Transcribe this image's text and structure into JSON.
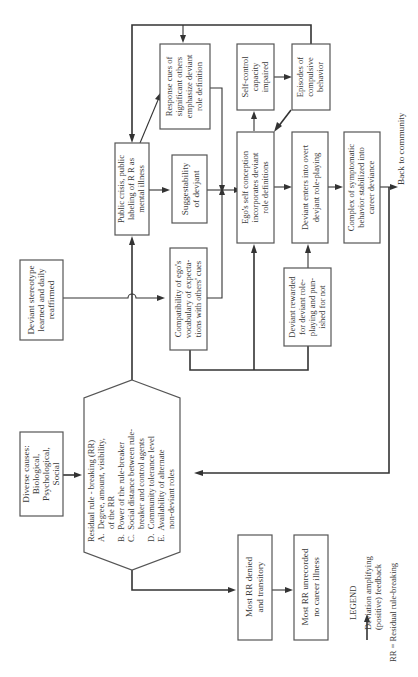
{
  "nodes": {
    "diverse_causes": {
      "lines": [
        "Diverse causes:",
        "Biological,",
        "Psychological,",
        "Social"
      ]
    },
    "residual_rule_breaking": {
      "lines": [
        "Residual rule - breaking (RR)",
        "A.  Degree, amount, visibility,",
        "      of the RR",
        "B.  Power of the rule-breaker",
        "C.  Social distance between rule-",
        "      breaker and control agents",
        "D.  Community tolerance level",
        "E.  Availability of alternate",
        "      non-deviant roles"
      ]
    },
    "deviant_stereotype": {
      "lines": [
        "Deviant stereotype",
        "learned and daily",
        "reaffirmed"
      ]
    },
    "most_rr_denied": {
      "lines": [
        "Most RR denied",
        "and transitory"
      ]
    },
    "most_rr_unrecorded": {
      "lines": [
        "Most RR unrecorded",
        "no career illness"
      ]
    },
    "public_crisis": {
      "lines": [
        "Public crisis, public",
        "labeling of R R as",
        "mental illness"
      ]
    },
    "compatibility": {
      "lines": [
        "Compatibility of ego's",
        "vocabulary of expecta-",
        "tions with others' cues"
      ]
    },
    "suggestability": {
      "lines": [
        "Suggestability",
        "of devjant"
      ]
    },
    "response_cues": {
      "lines": [
        "Response cues of",
        "significant others",
        "emphasize deviant",
        "role definition"
      ]
    },
    "ego_self_conception": {
      "lines": [
        "Ego's self conception",
        "incorporates deviant",
        "role definitions"
      ]
    },
    "self_control": {
      "lines": [
        "Self-control",
        "capacity",
        "impaired"
      ]
    },
    "episodes": {
      "lines": [
        "Episodes of",
        "compulsive",
        "behavior"
      ]
    },
    "deviant_rewarded": {
      "lines": [
        "Deviant rewarded",
        "for deviant role-",
        "playing and pun-",
        "ished for not"
      ]
    },
    "deviant_enters": {
      "lines": [
        "Deviant enters into overt",
        "devjant role-playing"
      ]
    },
    "complex_symptomatic": {
      "lines": [
        "Complex of symptomatic",
        "behavior stabilized into",
        "career deviance"
      ]
    }
  },
  "labels": {
    "back_to_community": "Back to community"
  },
  "legend": {
    "title": "LEGEND",
    "arrow_lines": [
      "Deviation amplifying",
      "(positive) feedback"
    ],
    "abbreviation": "RR = Residual rule-breaking"
  },
  "colors": {
    "ink": "#333333",
    "box_border": "#555555",
    "background": "#ffffff"
  }
}
